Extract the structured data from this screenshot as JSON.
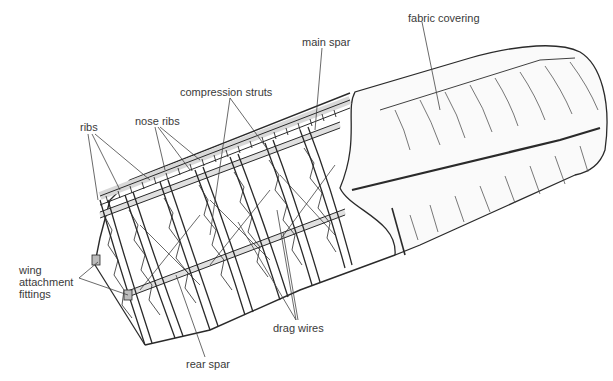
{
  "diagram": {
    "labels": {
      "fabric_covering": "fabric covering",
      "main_spar": "main spar",
      "compression_struts": "compression struts",
      "nose_ribs": "nose ribs",
      "ribs": "ribs",
      "wing_attachment_1": "wing",
      "wing_attachment_2": "attachment",
      "wing_attachment_3": "fittings",
      "drag_wires": "drag wires",
      "rear_spar": "rear spar"
    },
    "colors": {
      "line": "#2a2a2a",
      "leader": "#444444",
      "fabric": "#f7f7f7",
      "frame_fill": "#e6e6e6"
    }
  }
}
